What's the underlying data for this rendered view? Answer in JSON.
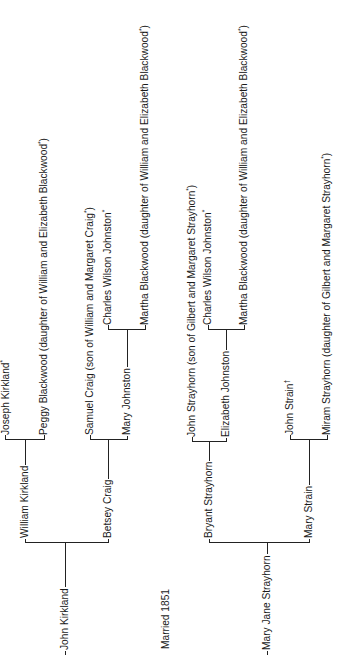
{
  "marriage": {
    "label": "Married 1851"
  },
  "husband": {
    "name": "John Kirkland",
    "father": {
      "name": "William Kirkland",
      "father": {
        "name": "Joseph Kirkland",
        "mark": "*"
      },
      "mother": {
        "name": "Peggy Blackwood (daughter of William and Elizabeth Blackwood",
        "mark": "*",
        "suffix": ")"
      }
    },
    "mother": {
      "name": "Betsey Craig",
      "father": {
        "name": "Samuel Craig (son of William and Margaret Craig",
        "mark": "*",
        "suffix": ")"
      },
      "mother": {
        "name": "Mary Johnston",
        "father": {
          "name": "Charles Wilson Johnston",
          "mark": "*"
        },
        "mother": {
          "name": "Martha Blackwood (daughter of William and Elizabeth Blackwood",
          "mark": "*",
          "suffix": ")"
        }
      }
    }
  },
  "wife": {
    "name": "Mary Jane Strayhorn",
    "father": {
      "name": "Bryant Strayhorn",
      "father": {
        "name": "John Strayhorn (son of Gilbert and Margaret Strayhorn",
        "mark": "*",
        "suffix": ")"
      },
      "mother": {
        "name": "Elizabeth Johnston",
        "father": {
          "name": "Charles Wilson Johnston",
          "mark": "*"
        },
        "mother": {
          "name": "Martha Blackwood (daughter of William and Elizabeth Blackwood",
          "mark": "*",
          "suffix": ")"
        }
      }
    },
    "mother": {
      "name": "Mary Strain",
      "father": {
        "name": "John Strain",
        "mark": "†"
      },
      "mother": {
        "name": "Miram Strayhorn (daughter of Gilbert and Margaret Strayhorn",
        "mark": "*",
        "suffix": ")"
      }
    }
  },
  "style": {
    "line_color": "#222222",
    "text_color": "#1a1a1a",
    "background": "#ffffff"
  }
}
